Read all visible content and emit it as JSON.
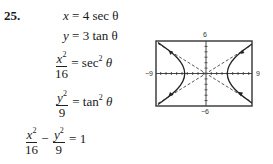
{
  "problem": {
    "number": "25.",
    "lines": [
      {
        "lhs_var": "x",
        "rhs": "4 sec θ"
      },
      {
        "lhs_var": "y",
        "rhs": "3 tan θ"
      },
      {
        "lhs_num": "x",
        "lhs_num_exp": "2",
        "lhs_den": "16",
        "rhs": "sec",
        "rhs_exp": "2",
        "rhs_tail": "θ"
      },
      {
        "lhs_num": "y",
        "lhs_num_exp": "2",
        "lhs_den": "9",
        "rhs": "tan",
        "rhs_exp": "2",
        "rhs_tail": "θ"
      }
    ],
    "final": {
      "a_num": "x",
      "a_exp": "2",
      "a_den": "16",
      "minus": "−",
      "b_num": "y",
      "b_exp": "2",
      "b_den": "9",
      "rhs": "= 1"
    },
    "equals": "="
  },
  "graph": {
    "x_min_label": "−9",
    "x_max_label": "9",
    "y_max_label": "6",
    "y_min_label": "−6",
    "equation": "x^2/16 - y^2/9 = 1",
    "asymptotes": [
      "y = 3x/4",
      "y = -3x/4"
    ]
  }
}
